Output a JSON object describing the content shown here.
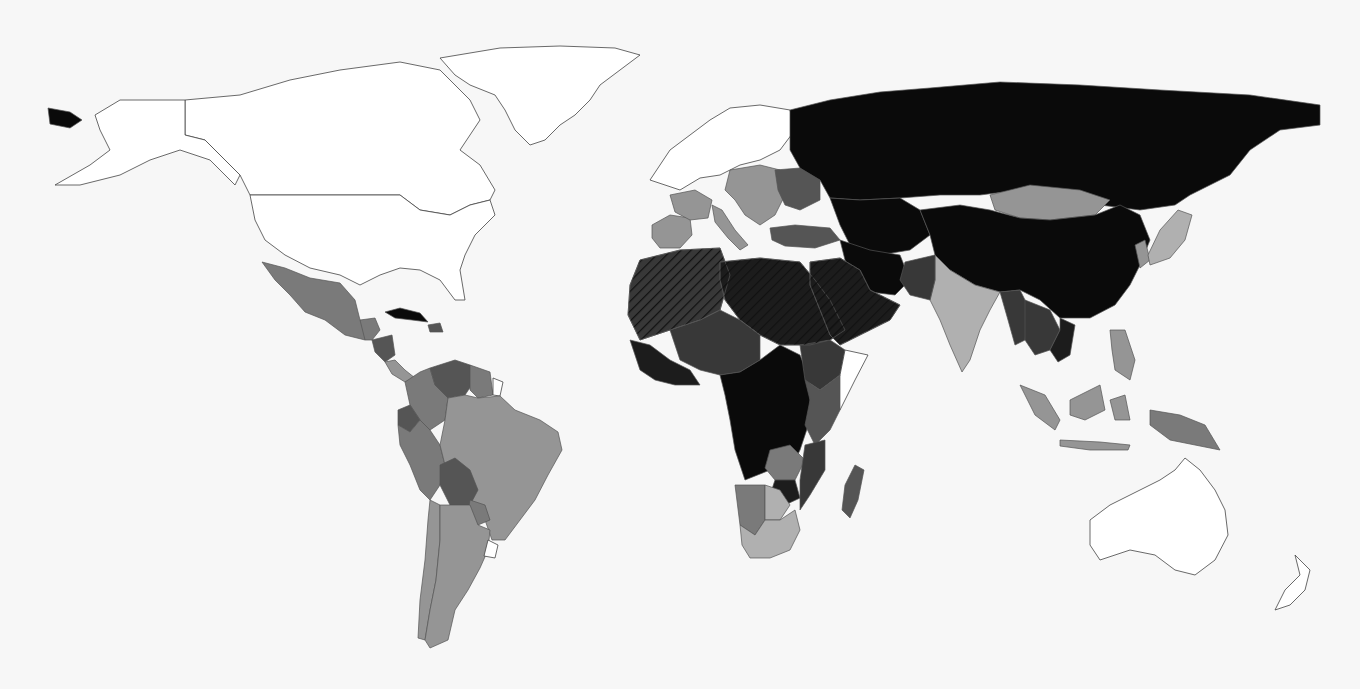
{
  "map": {
    "title": "",
    "type": "choropleth",
    "projection": "equirectangular-like world",
    "color_scale": {
      "no_data": "#ffffff",
      "level_1": "#b0b0b0",
      "level_2": "#959595",
      "level_3": "#7a7a7a",
      "level_4": "#555555",
      "level_5": "#383838",
      "level_6": "#1c1c1c",
      "level_7": "#0a0a0a"
    },
    "hatched_regions_note": "diagonal hatching over North Africa and Arabian Peninsula",
    "regions": [
      {
        "name": "Greenland",
        "level": "no_data"
      },
      {
        "name": "Canada",
        "level": "no_data"
      },
      {
        "name": "United States",
        "level": "no_data"
      },
      {
        "name": "Alaska",
        "level": "no_data"
      },
      {
        "name": "Chukotka",
        "level": "level_7"
      },
      {
        "name": "Mexico",
        "level": "level_3"
      },
      {
        "name": "Central America north",
        "level": "level_3"
      },
      {
        "name": "Honduras/Nicaragua",
        "level": "level_4"
      },
      {
        "name": "Costa Rica/Panama",
        "level": "level_2"
      },
      {
        "name": "Cuba",
        "level": "level_7"
      },
      {
        "name": "Hispaniola",
        "level": "level_4"
      },
      {
        "name": "Colombia",
        "level": "level_3"
      },
      {
        "name": "Venezuela",
        "level": "level_4"
      },
      {
        "name": "Guyana/Suriname",
        "level": "level_3"
      },
      {
        "name": "French Guiana",
        "level": "no_data"
      },
      {
        "name": "Ecuador",
        "level": "level_4"
      },
      {
        "name": "Peru",
        "level": "level_3"
      },
      {
        "name": "Brazil",
        "level": "level_2"
      },
      {
        "name": "Bolivia",
        "level": "level_4"
      },
      {
        "name": "Paraguay",
        "level": "level_3"
      },
      {
        "name": "Chile",
        "level": "level_2"
      },
      {
        "name": "Argentina",
        "level": "level_2"
      },
      {
        "name": "Uruguay",
        "level": "no_data"
      },
      {
        "name": "Western Europe",
        "level": "no_data"
      },
      {
        "name": "Iberia",
        "level": "level_2"
      },
      {
        "name": "France",
        "level": "level_2"
      },
      {
        "name": "Italy",
        "level": "level_2"
      },
      {
        "name": "Central Europe",
        "level": "level_2"
      },
      {
        "name": "Belarus/Ukraine",
        "level": "level_4"
      },
      {
        "name": "Turkey",
        "level": "level_4"
      },
      {
        "name": "Russia",
        "level": "level_7"
      },
      {
        "name": "Kazakhstan/Central Asia",
        "level": "level_7"
      },
      {
        "name": "Iran",
        "level": "level_7"
      },
      {
        "name": "Mongolia",
        "level": "level_2"
      },
      {
        "name": "China",
        "level": "level_7"
      },
      {
        "name": "Korea",
        "level": "level_2"
      },
      {
        "name": "Japan",
        "level": "level_1"
      },
      {
        "name": "India",
        "level": "level_1"
      },
      {
        "name": "Pakistan",
        "level": "level_5"
      },
      {
        "name": "Myanmar",
        "level": "level_5"
      },
      {
        "name": "Indochina",
        "level": "level_5"
      },
      {
        "name": "Vietnam",
        "level": "level_6"
      },
      {
        "name": "Indonesia",
        "level": "level_2"
      },
      {
        "name": "Philippines",
        "level": "level_2"
      },
      {
        "name": "Papua New Guinea",
        "level": "level_3"
      },
      {
        "name": "Australia",
        "level": "no_data"
      },
      {
        "name": "New Zealand",
        "level": "no_data"
      },
      {
        "name": "North-West Africa",
        "level": "level_5",
        "hatched": true
      },
      {
        "name": "North-East Africa",
        "level": "level_6",
        "hatched": true
      },
      {
        "name": "Arabian Peninsula",
        "level": "level_6",
        "hatched": true
      },
      {
        "name": "West Africa coast",
        "level": "level_6"
      },
      {
        "name": "Sahel",
        "level": "level_5"
      },
      {
        "name": "Central Africa",
        "level": "level_7"
      },
      {
        "name": "Ethiopia",
        "level": "level_5"
      },
      {
        "name": "Somalia",
        "level": "no_data"
      },
      {
        "name": "East Africa",
        "level": "level_4"
      },
      {
        "name": "Zambia",
        "level": "level_3"
      },
      {
        "name": "Zimbabwe",
        "level": "level_6"
      },
      {
        "name": "Mozambique",
        "level": "level_5"
      },
      {
        "name": "Namibia",
        "level": "level_3"
      },
      {
        "name": "Botswana",
        "level": "level_1"
      },
      {
        "name": "South Africa",
        "level": "level_1"
      },
      {
        "name": "Madagascar",
        "level": "level_4"
      }
    ]
  }
}
